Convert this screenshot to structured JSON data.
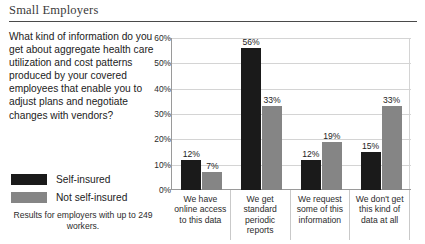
{
  "header": {
    "title": "Small Employers"
  },
  "question": {
    "text": "What kind of information do you get about aggregate health care utilization and cost patterns produced by your covered employees that enable you to adjust plans and negotiate changes with vendors?"
  },
  "legend": {
    "items": [
      {
        "label": "Self-insured",
        "color": "#1a1a1a"
      },
      {
        "label": "Not self-insured",
        "color": "#858585"
      }
    ]
  },
  "footnote": {
    "text": "Results for employers with up to 249 workers."
  },
  "chart_data": {
    "type": "bar",
    "title": "",
    "xlabel": "",
    "ylabel": "",
    "ylim": [
      0,
      60
    ],
    "ytick_labels": [
      "0%",
      "10%",
      "20%",
      "30%",
      "40%",
      "50%",
      "60%"
    ],
    "ytick_values": [
      0,
      10,
      20,
      30,
      40,
      50,
      60
    ],
    "grid": true,
    "legend_position": "left",
    "categories": [
      "We have online access to this data",
      "We get standard periodic reports",
      "We request some of this information",
      "We don't get this kind of data at all"
    ],
    "series": [
      {
        "name": "Self-insured",
        "color": "#1a1a1a",
        "values": [
          12,
          56,
          12,
          15
        ]
      },
      {
        "name": "Not self-insured",
        "color": "#858585",
        "values": [
          7,
          33,
          19,
          33
        ]
      }
    ],
    "value_labels": [
      [
        "12%",
        "56%",
        "12%",
        "15%"
      ],
      [
        "7%",
        "33%",
        "19%",
        "33%"
      ]
    ]
  }
}
